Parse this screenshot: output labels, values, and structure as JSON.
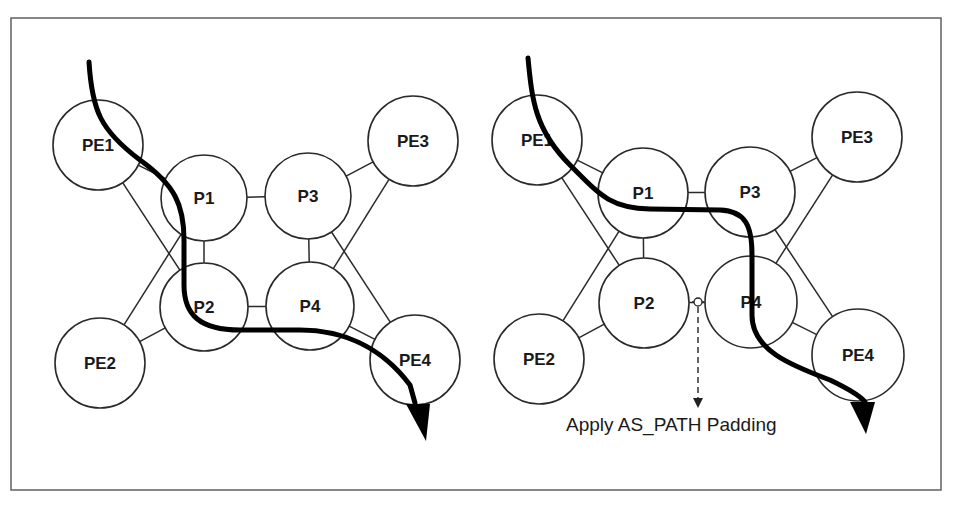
{
  "figure": {
    "width": 954,
    "height": 507,
    "frame": {
      "x": 11,
      "y": 18,
      "width": 930,
      "height": 472,
      "stroke": "#6a6a6a"
    }
  },
  "diagrams": [
    {
      "id": "left",
      "nodes": [
        {
          "id": "PE1",
          "label": "PE1",
          "cx": 98,
          "cy": 145,
          "r": 45
        },
        {
          "id": "PE2",
          "label": "PE2",
          "cx": 100,
          "cy": 363,
          "r": 45
        },
        {
          "id": "P1",
          "label": "P1",
          "cx": 204,
          "cy": 198,
          "r": 43
        },
        {
          "id": "P2",
          "label": "P2",
          "cx": 204,
          "cy": 307,
          "r": 44
        },
        {
          "id": "P3",
          "label": "P3",
          "cx": 308,
          "cy": 196,
          "r": 43
        },
        {
          "id": "P4",
          "label": "P4",
          "cx": 310,
          "cy": 306,
          "r": 44
        },
        {
          "id": "PE3",
          "label": "PE3",
          "cx": 413,
          "cy": 141,
          "r": 45
        },
        {
          "id": "PE4",
          "label": "PE4",
          "cx": 415,
          "cy": 360,
          "r": 45
        }
      ],
      "links": [
        [
          "PE1",
          "P1"
        ],
        [
          "PE1",
          "P2"
        ],
        [
          "PE2",
          "P1"
        ],
        [
          "PE2",
          "P2"
        ],
        [
          "P1",
          "P3"
        ],
        [
          "P1",
          "P2"
        ],
        [
          "P3",
          "P4"
        ],
        [
          "P2",
          "P4"
        ],
        [
          "PE3",
          "P3"
        ],
        [
          "PE3",
          "P4"
        ],
        [
          "PE4",
          "P4"
        ],
        [
          "PE4",
          "P3"
        ]
      ],
      "traffic_path": {
        "description": "PE1 -> P2 -> P4 -> PE4",
        "d": "M 89 62 C 92 110, 100 130, 140 160 C 175 185, 184 205, 184 240 L 184 285 C 184 315, 200 330, 240 330 L 300 330 C 340 330, 380 345, 410 385 L 415 403",
        "arrow": {
          "tip": [
            426,
            441
          ],
          "base_left": [
            406,
            404
          ],
          "base_right": [
            430,
            404
          ]
        }
      }
    },
    {
      "id": "right",
      "nodes": [
        {
          "id": "PE1",
          "label": "PE1",
          "cx": 537,
          "cy": 140,
          "r": 45
        },
        {
          "id": "PE2",
          "label": "PE2",
          "cx": 539,
          "cy": 359,
          "r": 45
        },
        {
          "id": "P1",
          "label": "P1",
          "cx": 643,
          "cy": 193,
          "r": 45
        },
        {
          "id": "P2",
          "label": "P2",
          "cx": 644,
          "cy": 303,
          "r": 45
        },
        {
          "id": "P3",
          "label": "P3",
          "cx": 750,
          "cy": 192,
          "r": 45
        },
        {
          "id": "P4",
          "label": "P4",
          "cx": 751,
          "cy": 302,
          "r": 46
        },
        {
          "id": "PE3",
          "label": "PE3",
          "cx": 857,
          "cy": 137,
          "r": 45
        },
        {
          "id": "PE4",
          "label": "PE4",
          "cx": 858,
          "cy": 355,
          "r": 46
        }
      ],
      "links": [
        [
          "PE1",
          "P1"
        ],
        [
          "PE1",
          "P2"
        ],
        [
          "PE2",
          "P1"
        ],
        [
          "PE2",
          "P2"
        ],
        [
          "P1",
          "P3"
        ],
        [
          "P1",
          "P2"
        ],
        [
          "P3",
          "P4"
        ],
        [
          "P2",
          "P4"
        ],
        [
          "PE3",
          "P3"
        ],
        [
          "PE3",
          "P4"
        ],
        [
          "PE4",
          "P4"
        ],
        [
          "PE4",
          "P3"
        ]
      ],
      "traffic_path": {
        "description": "PE1 -> P1 -> P3 -> P4 -> PE4",
        "d": "M 528 58 C 532 100, 535 130, 570 165 C 600 195, 610 208, 650 209 L 720 210 C 745 211, 752 225, 752 255 L 752 315 C 752 350, 790 365, 830 380 C 855 392, 862 398, 865 402",
        "arrow": {
          "tip": [
            866,
            434
          ],
          "base_left": [
            850,
            402
          ],
          "base_right": [
            875,
            402
          ]
        }
      },
      "annotation": {
        "text": "Apply AS_PATH Padding",
        "marker": {
          "cx": 698,
          "cy": 302,
          "r": 4
        },
        "line": {
          "x": 698,
          "y1": 307,
          "y2": 400
        },
        "arrow_tip": [
          698,
          408
        ],
        "text_x": 566,
        "text_y": 431
      }
    }
  ]
}
